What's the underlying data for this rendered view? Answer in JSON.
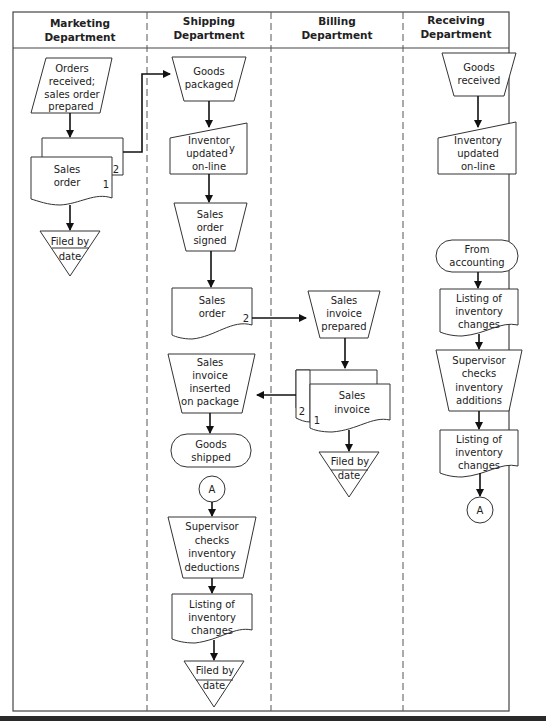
{
  "diagram": {
    "type": "swimlane-flowchart",
    "lanes": [
      {
        "id": "marketing",
        "title_line1": "Marketing",
        "title_line2": "Department"
      },
      {
        "id": "shipping",
        "title_line1": "Shipping",
        "title_line2": "Department"
      },
      {
        "id": "billing",
        "title_line1": "Billing",
        "title_line2": "Department"
      },
      {
        "id": "receiving",
        "title_line1": "Receiving",
        "title_line2": "Department"
      }
    ],
    "nodes": {
      "m_orders": {
        "shape": "manual-input",
        "lines": [
          "Orders",
          "received;",
          "sales order",
          "prepared"
        ]
      },
      "m_sales_order": {
        "shape": "multi-document",
        "lines": [
          "Sales",
          "order"
        ],
        "copy_front": "1",
        "copy_back": "2"
      },
      "m_filed": {
        "shape": "offline-storage",
        "lines": [
          "Filed by",
          "date"
        ]
      },
      "s_goods_packaged": {
        "shape": "manual-operation",
        "lines": [
          "Goods",
          "packaged"
        ]
      },
      "s_inventory_updated": {
        "shape": "manual-input",
        "lines": [
          "Inventor",
          "updated",
          "on-line"
        ],
        "mark": "y"
      },
      "s_sales_order_signed": {
        "shape": "manual-operation",
        "lines": [
          "Sales",
          "order",
          "signed"
        ]
      },
      "s_sales_order": {
        "shape": "document",
        "lines": [
          "Sales",
          "order"
        ],
        "copy": "2"
      },
      "s_invoice_inserted": {
        "shape": "manual-operation",
        "lines": [
          "Sales",
          "invoice",
          "inserted",
          "on package"
        ]
      },
      "s_goods_shipped": {
        "shape": "terminal",
        "lines": [
          "Goods",
          "shipped"
        ]
      },
      "s_connector_a": {
        "shape": "connector",
        "lines": [
          "A"
        ]
      },
      "s_supervisor": {
        "shape": "manual-operation",
        "lines": [
          "Supervisor",
          "checks",
          "inventory",
          "deductions"
        ]
      },
      "s_listing": {
        "shape": "document",
        "lines": [
          "Listing of",
          "inventory",
          "changes"
        ]
      },
      "s_filed": {
        "shape": "offline-storage",
        "lines": [
          "Filed by",
          "date"
        ]
      },
      "b_invoice_prepared": {
        "shape": "manual-operation",
        "lines": [
          "Sales",
          "invoice",
          "prepared"
        ]
      },
      "b_sales_invoice": {
        "shape": "multi-document",
        "lines": [
          "Sales",
          "invoice"
        ],
        "copy_front": "1",
        "copy_back": "2"
      },
      "b_filed": {
        "shape": "offline-storage",
        "lines": [
          "Filed by",
          "date"
        ]
      },
      "r_goods_received": {
        "shape": "manual-operation",
        "lines": [
          "Goods",
          "received"
        ]
      },
      "r_inventory_updated": {
        "shape": "manual-input",
        "lines": [
          "Inventory",
          "updated",
          "on-line"
        ]
      },
      "r_from_accounting": {
        "shape": "terminal",
        "lines": [
          "From",
          "accounting"
        ]
      },
      "r_listing1": {
        "shape": "document",
        "lines": [
          "Listing of",
          "inventory",
          "changes"
        ]
      },
      "r_supervisor": {
        "shape": "manual-operation",
        "lines": [
          "Supervisor",
          "checks",
          "inventory",
          "additions"
        ]
      },
      "r_listing2": {
        "shape": "document",
        "lines": [
          "Listing of",
          "inventory",
          "changes"
        ]
      },
      "r_connector_a": {
        "shape": "connector",
        "lines": [
          "A"
        ]
      }
    },
    "edges": [
      [
        "m_orders",
        "m_sales_order"
      ],
      [
        "m_sales_order",
        "m_filed"
      ],
      [
        "m_sales_order(copy 2)",
        "s_goods_packaged"
      ],
      [
        "s_goods_packaged",
        "s_inventory_updated"
      ],
      [
        "s_inventory_updated",
        "s_sales_order_signed"
      ],
      [
        "s_sales_order_signed",
        "s_sales_order"
      ],
      [
        "s_sales_order(copy 2)",
        "b_invoice_prepared"
      ],
      [
        "b_invoice_prepared",
        "b_sales_invoice"
      ],
      [
        "b_sales_invoice(copy 2)",
        "s_invoice_inserted"
      ],
      [
        "b_sales_invoice",
        "b_filed"
      ],
      [
        "s_invoice_inserted",
        "s_goods_shipped"
      ],
      [
        "s_connector_a",
        "s_supervisor"
      ],
      [
        "s_supervisor",
        "s_listing"
      ],
      [
        "s_listing",
        "s_filed"
      ],
      [
        "r_goods_received",
        "r_inventory_updated"
      ],
      [
        "r_from_accounting",
        "r_listing1"
      ],
      [
        "r_listing1",
        "r_supervisor"
      ],
      [
        "r_supervisor",
        "r_listing2"
      ],
      [
        "r_listing2",
        "r_connector_a"
      ]
    ],
    "colors": {
      "line": "#333333",
      "arrow": "#111111",
      "background": "#ffffff",
      "text": "#222222"
    }
  }
}
